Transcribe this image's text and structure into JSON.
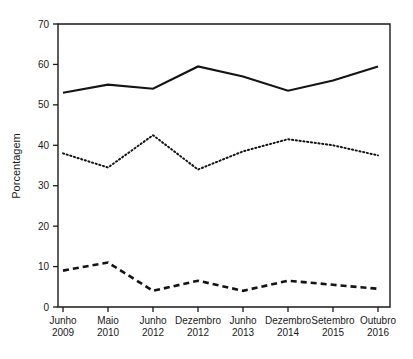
{
  "chart_data": {
    "type": "line",
    "title": "",
    "xlabel": "",
    "ylabel": "Porcentagem",
    "ylim": [
      0,
      70
    ],
    "yticks": [
      0,
      10,
      20,
      30,
      40,
      50,
      60,
      70
    ],
    "ytick_labels": [
      "0",
      "10",
      "20",
      "30",
      "40",
      "50",
      "60",
      "70"
    ],
    "grid": false,
    "legend": "none",
    "categories": [
      "Junho\n2009",
      "Maio\n2010",
      "Junho\n2012",
      "Dezembro\n2012",
      "Junho\n2013",
      "Dezembro\n2014",
      "Setembro\n2015",
      "Outubro\n2016"
    ],
    "xtick_labels": [
      {
        "month": "Junho",
        "year": "2009"
      },
      {
        "month": "Maio",
        "year": "2010"
      },
      {
        "month": "Junho",
        "year": "2012"
      },
      {
        "month": "Dezembro",
        "year": "2012"
      },
      {
        "month": "Junho",
        "year": "2013"
      },
      {
        "month": "Dezembro",
        "year": "2014"
      },
      {
        "month": "Setembro",
        "year": "2015"
      },
      {
        "month": "Outubro",
        "year": "2016"
      }
    ],
    "series": [
      {
        "name": "Série 1",
        "style": "solid",
        "values": [
          53,
          55,
          54,
          59.5,
          57,
          53.5,
          56,
          59.5
        ]
      },
      {
        "name": "Série 2",
        "style": "dotted",
        "values": [
          38,
          34.5,
          42.5,
          34,
          38.5,
          41.5,
          40,
          37.5
        ]
      },
      {
        "name": "Série 3",
        "style": "dashed",
        "values": [
          9,
          11,
          4,
          6.5,
          4,
          6.5,
          5.5,
          4.5
        ]
      }
    ]
  }
}
